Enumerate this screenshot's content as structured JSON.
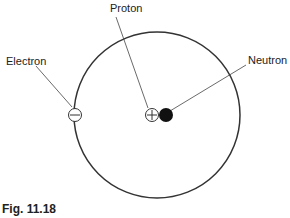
{
  "diagram": {
    "labels": {
      "proton": "Proton",
      "electron": "Electron",
      "neutron": "Neutron"
    },
    "symbols": {
      "proton": "+",
      "electron": "−"
    },
    "caption": "Fig. 11.18"
  }
}
